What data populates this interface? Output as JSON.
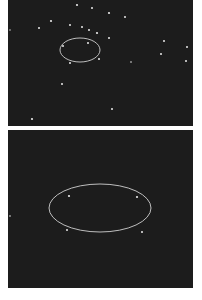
{
  "colors": {
    "page_bg": "#ffffff",
    "panel_bg": "#1c1c1c",
    "star": "#e8e8e8",
    "ellipse": "#cfcfcf"
  },
  "panels": [
    {
      "id": "top",
      "width": 185,
      "height": 126,
      "ellipse": {
        "cx": 72,
        "cy": 50,
        "rx": 20,
        "ry": 12
      },
      "stars": [
        [
          69,
          5,
          1.1
        ],
        [
          84,
          8,
          1.0
        ],
        [
          101,
          13,
          1.1
        ],
        [
          117,
          17,
          1.0
        ],
        [
          43,
          21,
          1.1
        ],
        [
          62,
          25,
          1.0
        ],
        [
          31,
          28,
          1.0
        ],
        [
          74,
          27,
          1.0
        ],
        [
          81,
          30,
          1.0
        ],
        [
          89,
          33,
          1.1
        ],
        [
          101,
          38,
          1.0
        ],
        [
          80,
          43,
          1.0
        ],
        [
          55,
          46,
          1.0
        ],
        [
          91,
          59,
          1.0
        ],
        [
          62,
          63,
          1.0
        ],
        [
          123,
          62,
          0.8
        ],
        [
          156,
          41,
          1.0
        ],
        [
          153,
          54,
          1.0
        ],
        [
          179,
          47,
          1.0
        ],
        [
          178,
          61,
          1.0
        ],
        [
          54,
          84,
          1.0
        ],
        [
          104,
          109,
          1.0
        ],
        [
          24,
          119,
          1.1
        ],
        [
          2,
          30,
          0.7
        ]
      ]
    },
    {
      "id": "bottom",
      "width": 185,
      "height": 158,
      "ellipse": {
        "cx": 92,
        "cy": 78,
        "rx": 51,
        "ry": 24
      },
      "stars": [
        [
          61,
          66,
          1.1
        ],
        [
          129,
          67,
          1.1
        ],
        [
          59,
          100,
          1.0
        ],
        [
          134,
          102,
          1.0
        ],
        [
          2,
          86,
          0.8
        ]
      ]
    }
  ]
}
